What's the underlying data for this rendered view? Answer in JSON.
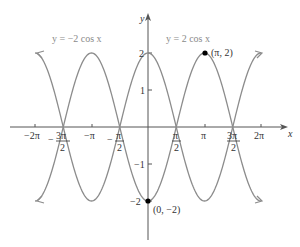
{
  "chart_data": {
    "type": "line",
    "title": "",
    "xlabel": "x",
    "ylabel": "y",
    "xlim": [
      -6.283,
      6.283
    ],
    "ylim": [
      -2,
      2
    ],
    "grid": false,
    "series": [
      {
        "name": "y = 2 cos x",
        "expression": "2*cos(x)",
        "x_range": [
          -6.283,
          6.283
        ]
      },
      {
        "name": "y = −2 cos x",
        "expression": "-2*cos(x)",
        "x_range": [
          -6.283,
          6.283
        ]
      }
    ],
    "x_ticks": [
      "−2π",
      "−3π/2",
      "−π",
      "−π/2",
      "π/2",
      "π",
      "3π/2",
      "2π"
    ],
    "y_ticks": [
      "2",
      "1",
      "−1",
      "−2"
    ],
    "points": [
      {
        "label": "(π, 2)",
        "x": 3.1416,
        "y": 2
      },
      {
        "label": "(0, −2)",
        "x": 0,
        "y": -2
      }
    ],
    "annotations": [
      "y = −2 cos x",
      "y = 2 cos x"
    ]
  },
  "labels": {
    "x_axis": "x",
    "y_axis": "y",
    "eq_neg": "y = −2 cos x",
    "eq_pos": "y = 2 cos x",
    "pt_pi": "(π, 2)",
    "pt_zero": "(0, −2)",
    "xt_m2pi": "−2π",
    "xt_mpi": "−π",
    "xt_pi": "π",
    "xt_2pi": "2π",
    "xt_m3pi_num": "3π",
    "xt_mpi2_num": "π",
    "xt_pi2_num": "π",
    "xt_3pi2_num": "3π",
    "frac_den": "2",
    "minus": "−",
    "yt_2": "2",
    "yt_1": "1",
    "yt_m1": "−1",
    "yt_m2": "−2"
  }
}
